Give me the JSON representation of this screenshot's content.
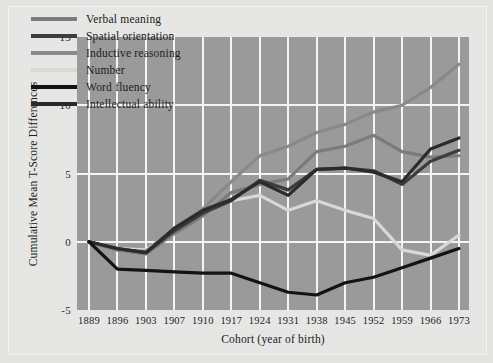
{
  "chart_data": {
    "type": "line",
    "title": "",
    "xlabel": "Cohort (year of birth)",
    "ylabel": "Cumulative Mean T-Score Differences",
    "categories": [
      "1889",
      "1896",
      "1903",
      "1907",
      "1910",
      "1917",
      "1924",
      "1931",
      "1938",
      "1945",
      "1952",
      "1959",
      "1966",
      "1973"
    ],
    "ylim": [
      -5,
      15
    ],
    "yticks": [
      "15",
      "10",
      "5",
      "0",
      "-5"
    ],
    "ytick_values": [
      15,
      10,
      5,
      0,
      -5
    ],
    "grid": true,
    "legend_position": "upper-left-inside",
    "series": [
      {
        "name": "Verbal meaning",
        "color": "#7b7b7b",
        "values": [
          0,
          -0.6,
          -0.9,
          0.6,
          1.9,
          3.6,
          4.2,
          4.6,
          6.6,
          7.0,
          7.8,
          6.6,
          6.2,
          6.3
        ]
      },
      {
        "name": "Spatial orientation",
        "color": "#3c3c3c",
        "values": [
          0,
          -0.5,
          -0.8,
          0.8,
          2.1,
          3.0,
          4.5,
          3.8,
          5.3,
          5.4,
          5.2,
          4.2,
          5.9,
          6.7
        ]
      },
      {
        "name": "Inductive reasoning",
        "color": "#898989",
        "values": [
          0,
          -0.6,
          -0.7,
          1.0,
          2.4,
          4.4,
          6.3,
          7.0,
          8.0,
          8.6,
          9.5,
          10.0,
          11.3,
          13.0
        ]
      },
      {
        "name": "Number",
        "color": "#d8d8d5",
        "values": [
          0,
          -0.5,
          -0.6,
          0.9,
          2.2,
          3.0,
          3.4,
          2.3,
          3.0,
          2.3,
          1.7,
          -0.6,
          -1.0,
          0.5
        ]
      },
      {
        "name": "Word fluency",
        "color": "#131313",
        "values": [
          0,
          -2.0,
          -2.1,
          -2.2,
          -2.3,
          -2.3,
          -3.0,
          -3.7,
          -3.9,
          -3.0,
          -2.6,
          -1.9,
          -1.2,
          -0.5
        ]
      },
      {
        "name": "Intellectual ability",
        "color": "#2b2b2b",
        "values": [
          0,
          -0.5,
          -0.8,
          1.0,
          2.3,
          3.1,
          4.4,
          3.4,
          5.3,
          5.4,
          5.1,
          4.4,
          6.8,
          7.6
        ]
      }
    ]
  },
  "colors": {
    "page_background": "#e3e3e2",
    "plot_background": "#9a9a9a",
    "gridline": "#f4f4f3",
    "text": "#1d1a18"
  }
}
